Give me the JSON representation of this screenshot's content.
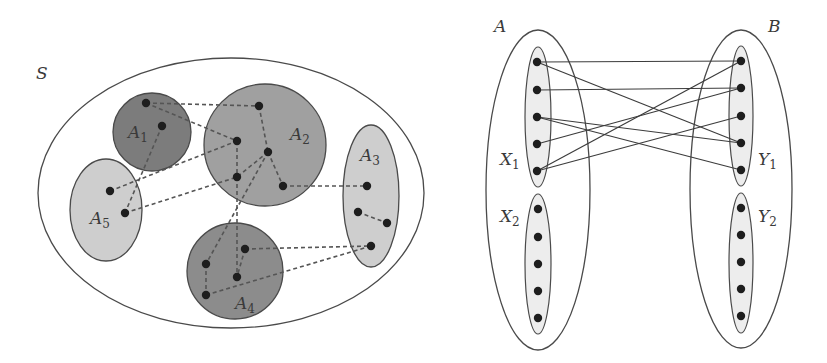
{
  "left_diagram": {
    "universe": {
      "label": "S",
      "cx": 231,
      "cy": 193,
      "rx": 193,
      "ry": 135,
      "label_x": 36,
      "label_y": 79
    },
    "colors": {
      "dark": "#7c7c7c",
      "medium_dark": "#8c8c8c",
      "medium": "#a0a0a0",
      "light": "#cecece",
      "stroke": "#4a4a4a",
      "dot": "#1e1e1e"
    },
    "sets": [
      {
        "id": "A1",
        "label": "A",
        "sub": "1",
        "shape": "circle",
        "cx": 152,
        "cy": 132,
        "rx": 39,
        "ry": 39,
        "fill": "#7c7c7c",
        "label_x": 128,
        "label_y": 138,
        "points": [
          [
            146,
            103
          ],
          [
            162,
            126
          ]
        ]
      },
      {
        "id": "A2",
        "label": "A",
        "sub": "2",
        "shape": "circle",
        "cx": 265,
        "cy": 145,
        "rx": 61,
        "ry": 61,
        "fill": "#a0a0a0",
        "label_x": 290,
        "label_y": 140,
        "points": [
          [
            259,
            106
          ],
          [
            237,
            141
          ],
          [
            268,
            152
          ],
          [
            237,
            177
          ],
          [
            283,
            186
          ]
        ]
      },
      {
        "id": "A3",
        "label": "A",
        "sub": "3",
        "shape": "ellipse",
        "cx": 371,
        "cy": 196,
        "rx": 28,
        "ry": 71,
        "fill": "#cecece",
        "label_x": 360,
        "label_y": 161,
        "points": [
          [
            367,
            186
          ],
          [
            358,
            212
          ],
          [
            387,
            223
          ],
          [
            371,
            246
          ]
        ]
      },
      {
        "id": "A4",
        "label": "A",
        "sub": "4",
        "shape": "circle",
        "cx": 235,
        "cy": 271,
        "rx": 48,
        "ry": 48,
        "fill": "#8c8c8c",
        "label_x": 235,
        "label_y": 309,
        "points": [
          [
            245,
            249
          ],
          [
            206,
            264
          ],
          [
            237,
            277
          ],
          [
            206,
            295
          ]
        ]
      },
      {
        "id": "A5",
        "label": "A",
        "sub": "5",
        "shape": "ellipse",
        "cx": 106,
        "cy": 210,
        "rx": 36,
        "ry": 51,
        "fill": "#cecece",
        "label_x": 90,
        "label_y": 224,
        "points": [
          [
            110,
            191
          ],
          [
            125,
            213
          ]
        ]
      }
    ],
    "dashed_edges": [
      [
        [
          146,
          103
        ],
        [
          259,
          106
        ]
      ],
      [
        [
          146,
          103
        ],
        [
          237,
          141
        ]
      ],
      [
        [
          162,
          126
        ],
        [
          125,
          213
        ]
      ],
      [
        [
          110,
          191
        ],
        [
          237,
          141
        ]
      ],
      [
        [
          125,
          213
        ],
        [
          237,
          177
        ]
      ],
      [
        [
          259,
          106
        ],
        [
          268,
          152
        ]
      ],
      [
        [
          237,
          141
        ],
        [
          237,
          177
        ]
      ],
      [
        [
          268,
          152
        ],
        [
          237,
          177
        ]
      ],
      [
        [
          268,
          152
        ],
        [
          283,
          186
        ]
      ],
      [
        [
          268,
          152
        ],
        [
          206,
          264
        ]
      ],
      [
        [
          237,
          177
        ],
        [
          237,
          277
        ]
      ],
      [
        [
          283,
          186
        ],
        [
          367,
          186
        ]
      ],
      [
        [
          245,
          249
        ],
        [
          237,
          277
        ]
      ],
      [
        [
          206,
          264
        ],
        [
          206,
          295
        ]
      ],
      [
        [
          245,
          249
        ],
        [
          371,
          246
        ]
      ],
      [
        [
          206,
          295
        ],
        [
          371,
          246
        ]
      ],
      [
        [
          358,
          212
        ],
        [
          387,
          223
        ]
      ]
    ]
  },
  "right_diagram": {
    "sets": [
      {
        "id": "A",
        "label": "A",
        "cx": 538,
        "cy": 190,
        "rx": 52,
        "ry": 160,
        "label_x": 494,
        "label_y": 32
      },
      {
        "id": "B",
        "label": "B",
        "cx": 741,
        "cy": 189,
        "rx": 51,
        "ry": 159,
        "label_x": 768,
        "label_y": 32
      }
    ],
    "subsets": [
      {
        "id": "X1",
        "label": "X",
        "sub": "1",
        "cx": 538,
        "cy": 117,
        "rx": 13,
        "ry": 70,
        "fill": "#ededed",
        "label_x": 500,
        "label_y": 165,
        "points": [
          [
            537,
            62
          ],
          [
            537,
            90
          ],
          [
            537,
            117
          ],
          [
            537,
            144
          ],
          [
            537,
            171
          ]
        ]
      },
      {
        "id": "X2",
        "label": "X",
        "sub": "2",
        "cx": 538,
        "cy": 264,
        "rx": 13,
        "ry": 70,
        "fill": "#ededed",
        "label_x": 500,
        "label_y": 222,
        "points": [
          [
            538,
            209
          ],
          [
            538,
            237
          ],
          [
            538,
            264
          ],
          [
            538,
            291
          ],
          [
            538,
            318
          ]
        ]
      },
      {
        "id": "Y1",
        "label": "Y",
        "sub": "1",
        "cx": 741,
        "cy": 116,
        "rx": 12,
        "ry": 70,
        "fill": "#ededed",
        "label_x": 758,
        "label_y": 165,
        "points": [
          [
            741,
            61
          ],
          [
            741,
            88
          ],
          [
            741,
            116
          ],
          [
            741,
            143
          ],
          [
            741,
            170
          ]
        ]
      },
      {
        "id": "Y2",
        "label": "Y",
        "sub": "2",
        "cx": 741,
        "cy": 263,
        "rx": 12,
        "ry": 70,
        "fill": "#ededed",
        "label_x": 758,
        "label_y": 222,
        "points": [
          [
            741,
            208
          ],
          [
            741,
            235
          ],
          [
            741,
            262
          ],
          [
            741,
            289
          ],
          [
            741,
            316
          ]
        ]
      }
    ],
    "edges": [
      {
        "from": "X1.0",
        "to": "Y1.0"
      },
      {
        "from": "X1.0",
        "to": "Y1.3"
      },
      {
        "from": "X1.1",
        "to": "Y1.1"
      },
      {
        "from": "X1.2",
        "to": "Y1.3"
      },
      {
        "from": "X1.2",
        "to": "Y1.4"
      },
      {
        "from": "X1.3",
        "to": "Y1.1"
      },
      {
        "from": "X1.4",
        "to": "Y1.0"
      },
      {
        "from": "X1.4",
        "to": "Y1.2"
      }
    ]
  }
}
